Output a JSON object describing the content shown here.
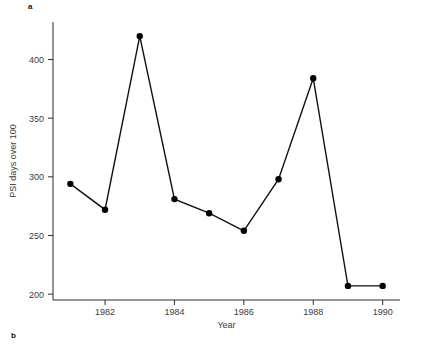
{
  "panels": {
    "top_label": "a",
    "bottom_label": "b"
  },
  "chart_data": {
    "type": "line",
    "title": "",
    "xlabel": "Year",
    "ylabel": "PSI days over 100",
    "x": [
      1981,
      1982,
      1983,
      1984,
      1985,
      1986,
      1987,
      1988,
      1989,
      1990
    ],
    "values": [
      294,
      272,
      420,
      281,
      269,
      254,
      298,
      384,
      207,
      207
    ],
    "xlim": [
      1980.5,
      1990.5
    ],
    "ylim": [
      195,
      432
    ],
    "xticks": [
      1982,
      1984,
      1986,
      1988,
      1990
    ],
    "xticklabels": [
      "1982",
      "1984",
      "1986",
      "1988",
      "1990"
    ],
    "yticks": [
      200,
      250,
      300,
      350,
      400
    ],
    "yticklabels": [
      "200",
      "250",
      "300",
      "350",
      "400"
    ],
    "grid": false,
    "legend": false,
    "marker": "filled-circle",
    "line_color": "#111111",
    "marker_color": "#000000"
  }
}
